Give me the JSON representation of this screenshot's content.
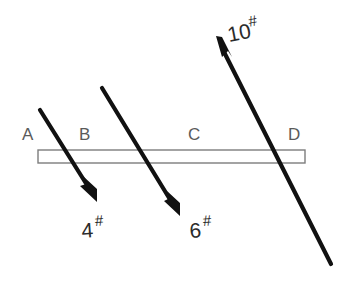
{
  "figure": {
    "background_color": "#ffffff",
    "beam": {
      "name": "beam",
      "label": "",
      "outline_color": "#7d7d7d",
      "fill_color": "#ffffff",
      "x": 38,
      "y": 150,
      "width": 267,
      "height": 13
    },
    "point_labels": [
      {
        "id": "A",
        "text": "A",
        "x": 22,
        "y": 140,
        "color": "#5a5a5a"
      },
      {
        "id": "B",
        "text": "B",
        "x": 79,
        "y": 140,
        "color": "#5a5a5a"
      },
      {
        "id": "C",
        "text": "C",
        "x": 188,
        "y": 140,
        "color": "#5a5a5a"
      },
      {
        "id": "D",
        "text": "D",
        "x": 288,
        "y": 140,
        "color": "#5a5a5a"
      }
    ],
    "forces": [
      {
        "id": "force-4",
        "magnitude": "4",
        "unit": "#",
        "label": "4#",
        "color": "#111111",
        "direction": "down-right",
        "tail_x": 40,
        "tail_y": 110,
        "head_x": 97,
        "head_y": 202,
        "label_x": 82,
        "label_y": 238,
        "label_sup_x": 96,
        "label_sup_y": 227
      },
      {
        "id": "force-6",
        "magnitude": "6",
        "unit": "#",
        "label": "6#",
        "color": "#111111",
        "direction": "down-right",
        "tail_x": 102,
        "tail_y": 88,
        "head_x": 180,
        "head_y": 216,
        "label_x": 190,
        "label_y": 238,
        "label_sup_x": 204,
        "label_sup_y": 227
      },
      {
        "id": "force-10",
        "magnitude": "10",
        "unit": "#",
        "label": "10#",
        "color": "#111111",
        "direction": "up-left",
        "tail_x": 331,
        "tail_y": 264,
        "head_x": 216,
        "head_y": 36,
        "label_x": 229,
        "label_y": 42,
        "label_sup_x": 250,
        "label_sup_y": 31
      }
    ]
  }
}
